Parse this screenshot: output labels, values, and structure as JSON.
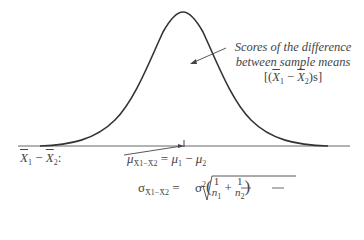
{
  "diagram": {
    "type": "sampling-distribution-of-difference-between-means",
    "curve": {
      "shape": "normal",
      "color": "#333333"
    },
    "annotation": {
      "line1": "Scores of the difference",
      "line2": "between sample means",
      "line3_prefix": "[(",
      "line3_x1": "X",
      "line3_sub1": "1",
      "line3_minus": " − ",
      "line3_x2": "X",
      "line3_sub2": "2",
      "line3_suffix": ")s]"
    },
    "axis_label": {
      "x1": "X",
      "sub1": "1",
      "minus": " − ",
      "x2": "X",
      "sub2": "2",
      "colon": ":"
    },
    "mean_formula": {
      "symbol": "μ",
      "subscript": "X̄1−X̄2",
      "equals": " = ",
      "rhs_mu1": "μ",
      "rhs_sub1": "1",
      "rhs_minus": " − ",
      "rhs_mu2": "μ",
      "rhs_sub2": "2"
    },
    "sd_formula": {
      "symbol": "σ",
      "subscript": "X̄1−X̄2",
      "equals": " = ",
      "sigma_sq": "σ",
      "sup": "2",
      "one_a": "1",
      "n1": "n",
      "n1_sub": "1",
      "plus": "+",
      "one_b": "1",
      "n2": "n",
      "n2_sub": "2"
    }
  }
}
